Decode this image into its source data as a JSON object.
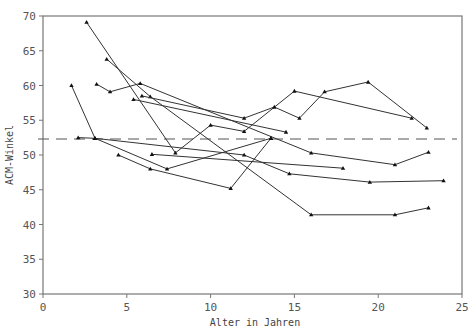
{
  "chart_data": {
    "type": "line",
    "title": "",
    "xlabel": "Alter in Jahren",
    "ylabel": "ACM-Winkel",
    "xlim": [
      0,
      25
    ],
    "ylim": [
      30,
      70
    ],
    "xticks": [
      0,
      5,
      10,
      15,
      20,
      25
    ],
    "yticks": [
      30,
      35,
      40,
      45,
      50,
      55,
      60,
      65,
      70
    ],
    "grid": false,
    "legend": null,
    "reference_line": {
      "y": 52.3,
      "style": "dashed"
    },
    "series": [
      {
        "name": "Patient 1",
        "points": [
          [
            2.6,
            69.1
          ],
          [
            7.9,
            50.3
          ],
          [
            10.0,
            54.3
          ],
          [
            12.0,
            53.4
          ],
          [
            15.0,
            59.2
          ],
          [
            22.0,
            55.3
          ]
        ]
      },
      {
        "name": "Patient 2",
        "points": [
          [
            3.8,
            63.8
          ],
          [
            6.4,
            58.4
          ],
          [
            16.0,
            41.4
          ],
          [
            21.0,
            41.4
          ],
          [
            23.0,
            42.4
          ]
        ]
      },
      {
        "name": "Patient 3",
        "points": [
          [
            3.2,
            60.2
          ],
          [
            4.0,
            59.1
          ],
          [
            5.8,
            60.3
          ],
          [
            16.0,
            50.3
          ],
          [
            21.0,
            48.6
          ],
          [
            23.0,
            50.4
          ]
        ]
      },
      {
        "name": "Patient 4",
        "points": [
          [
            5.9,
            58.5
          ],
          [
            12.0,
            55.3
          ],
          [
            13.8,
            56.9
          ],
          [
            15.3,
            55.3
          ],
          [
            16.8,
            59.1
          ],
          [
            19.4,
            60.5
          ],
          [
            22.9,
            53.9
          ]
        ]
      },
      {
        "name": "Patient 5",
        "points": [
          [
            5.4,
            58.0
          ],
          [
            14.5,
            53.3
          ]
        ]
      },
      {
        "name": "Patient 6",
        "points": [
          [
            1.7,
            60.0
          ],
          [
            3.1,
            52.4
          ],
          [
            12.0,
            50.0
          ],
          [
            14.7,
            47.3
          ],
          [
            19.5,
            46.1
          ],
          [
            23.9,
            46.3
          ]
        ]
      },
      {
        "name": "Patient 7",
        "points": [
          [
            2.1,
            52.5
          ],
          [
            3.1,
            52.4
          ],
          [
            7.4,
            48.0
          ],
          [
            13.6,
            52.4
          ]
        ]
      },
      {
        "name": "Patient 8",
        "points": [
          [
            4.5,
            50.0
          ],
          [
            6.4,
            48.0
          ],
          [
            11.2,
            45.2
          ],
          [
            13.6,
            52.4
          ]
        ]
      },
      {
        "name": "Patient 9",
        "points": [
          [
            6.5,
            50.1
          ],
          [
            17.9,
            48.1
          ]
        ]
      }
    ]
  },
  "axes": {
    "x_title": "Alter in Jahren",
    "y_title": "ACM-Winkel",
    "x_tick_labels": [
      "0",
      "5",
      "10",
      "15",
      "20",
      "25"
    ],
    "y_tick_labels": [
      "30",
      "35",
      "40",
      "45",
      "50",
      "55",
      "60",
      "65",
      "70"
    ]
  },
  "colors": {
    "line": "#333333",
    "axis": "#777777",
    "dashed": "#555555"
  }
}
